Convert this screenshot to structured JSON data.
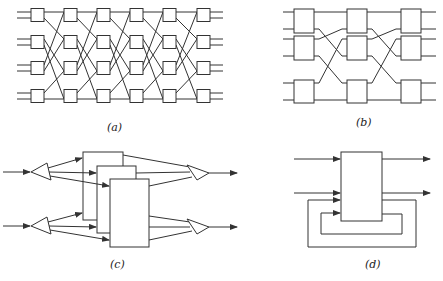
{
  "figure": {
    "panels": [
      {
        "id": "a",
        "label": "(a)",
        "description": "Multistage shuffle interconnection network: 4 rows x 6 columns of 2x2 switching boxes, each with two input and two output lines"
      },
      {
        "id": "b",
        "label": "(b)",
        "description": "Three-stage network with 3 switching boxes per stage and crossing interconnections"
      },
      {
        "id": "c",
        "label": "(c)",
        "description": "Two inputs split by splitters to three stacked parallel processing units, recombined by combiners into two outputs"
      },
      {
        "id": "d",
        "label": "(d)",
        "description": "Single unit with two inputs, two outputs and two feedback loops"
      }
    ]
  },
  "colors": {
    "stroke": "#333333",
    "background": "#ffffff"
  }
}
